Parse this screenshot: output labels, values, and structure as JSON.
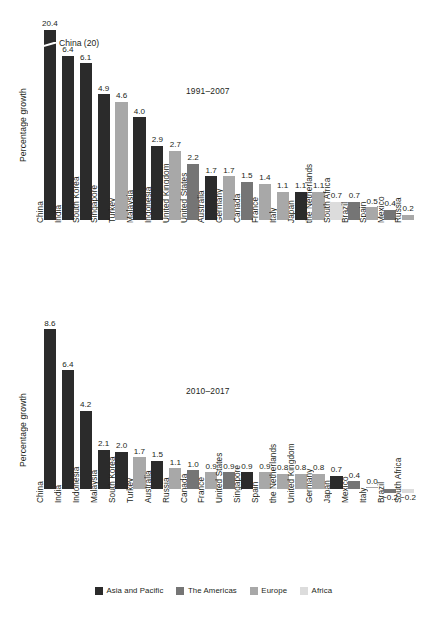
{
  "figure": {
    "ylabel": "Percentage growth",
    "legend": {
      "position": "bottom-center",
      "items": [
        {
          "label": "Asia and Pacific",
          "color": "#2b2b2b"
        },
        {
          "label": "The Americas",
          "color": "#757575"
        },
        {
          "label": "Europe",
          "color": "#a8a8a8"
        },
        {
          "label": "Africa",
          "color": "#dcdcdc"
        }
      ]
    }
  },
  "annotations": {
    "china_break": "China (20)"
  },
  "chart_data": [
    {
      "type": "bar",
      "title": "1991–2007",
      "xlabel": "",
      "ylabel": "Percentage growth",
      "ylim": [
        0,
        7.4
      ],
      "grid": false,
      "note": "China bar is broken/truncated; true value 20.4",
      "broken_bar_category": "China",
      "categories": [
        "China",
        "India",
        "South Korea",
        "Singapore",
        "Turkey",
        "Malaysia",
        "Indonesia",
        "United Kingdom",
        "United States",
        "Australia",
        "Germany",
        "Canada",
        "France",
        "Italy",
        "Japan",
        "the Netherlands",
        "South Africa",
        "Brazil",
        "Spain",
        "Mexico",
        "Russia"
      ],
      "values": [
        20.4,
        6.4,
        6.1,
        4.9,
        4.6,
        4.0,
        2.9,
        2.7,
        2.2,
        1.7,
        1.7,
        1.5,
        1.4,
        1.1,
        1.1,
        1.1,
        0.7,
        0.7,
        0.5,
        0.4,
        0.2
      ],
      "value_labels": [
        "20.4",
        "6.4",
        "6.1",
        "4.9",
        "4.6",
        "4.0",
        "2.9",
        "2.7",
        "2.2",
        "1.7",
        "1.7",
        "1.5",
        "1.4",
        "1.1",
        "1.1",
        "1.1",
        "0.7",
        "0.7",
        "0.5",
        "0.4",
        "0.2"
      ],
      "groups": [
        "Asia and Pacific",
        "Asia and Pacific",
        "Asia and Pacific",
        "Asia and Pacific",
        "Europe",
        "Asia and Pacific",
        "Asia and Pacific",
        "Europe",
        "The Americas",
        "Asia and Pacific",
        "Europe",
        "The Americas",
        "Europe",
        "Europe",
        "Asia and Pacific",
        "Europe",
        "Africa",
        "The Americas",
        "Europe",
        "The Americas",
        "Europe"
      ]
    },
    {
      "type": "bar",
      "title": "2010–2017",
      "xlabel": "",
      "ylabel": "Percentage growth",
      "ylim": [
        -0.5,
        9.0
      ],
      "grid": false,
      "categories": [
        "China",
        "India",
        "Indonesia",
        "Malaysia",
        "South Korea",
        "Turkey",
        "Australia",
        "Russia",
        "Canada",
        "France",
        "United States",
        "Singapore",
        "Spain",
        "the Netherlands",
        "United Kingdom",
        "Germany",
        "Japan",
        "Mexico",
        "Italy",
        "Brazil",
        "South Africa"
      ],
      "values": [
        8.6,
        6.4,
        4.2,
        2.1,
        2.0,
        1.7,
        1.5,
        1.1,
        1.0,
        0.9,
        0.9,
        0.9,
        0.9,
        0.8,
        0.8,
        0.8,
        0.7,
        0.4,
        0.0,
        -0.2,
        -0.2
      ],
      "value_labels": [
        "8.6",
        "6.4",
        "4.2",
        "2.1",
        "2.0",
        "1.7",
        "1.5",
        "1.1",
        "1.0",
        "0.9",
        "0.9",
        "0.9",
        "0.9",
        "0.8",
        "0.8",
        "0.8",
        "0.7",
        "0.4",
        "0.0",
        "−0.2",
        "−0.2"
      ],
      "groups": [
        "Asia and Pacific",
        "Asia and Pacific",
        "Asia and Pacific",
        "Asia and Pacific",
        "Asia and Pacific",
        "Europe",
        "Asia and Pacific",
        "Europe",
        "The Americas",
        "Europe",
        "The Americas",
        "Asia and Pacific",
        "Europe",
        "Europe",
        "Europe",
        "Europe",
        "Asia and Pacific",
        "The Americas",
        "Europe",
        "The Americas",
        "Africa"
      ]
    }
  ]
}
